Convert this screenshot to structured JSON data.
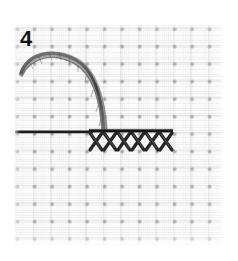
{
  "image": {
    "kind": "embroidery-instruction-photo",
    "subject": "cross-stitch row worked on white aida fabric",
    "width": 238,
    "height": 261,
    "background_color": "#ffffff"
  },
  "step": {
    "number": "4",
    "label": "step-number-4"
  },
  "fabric": {
    "name": "aida-cloth",
    "base_color": "#fbfbfb",
    "thread_band_color": "#cdcfd2",
    "intersection_dot_color": "#787c82",
    "grid_pitch_px": 17.5,
    "bounds": {
      "left": 13,
      "top": 25,
      "width": 209,
      "height": 221
    }
  },
  "elements": {
    "thread_loop": {
      "name": "curved-thread-loop",
      "color": "#4a4a4a",
      "description": "twisted floss arcing from upper-left down to the stitch row",
      "start": {
        "x": 22,
        "y": 72
      },
      "apex": {
        "x": 62,
        "y": 53
      },
      "end": {
        "x": 104,
        "y": 128
      }
    },
    "needle_line": {
      "name": "horizontal-needle-thread",
      "color": "#1c1c1c",
      "description": "straight dark thread/needle entering from the left edge",
      "start": {
        "x": 15,
        "y": 132
      },
      "end": {
        "x": 92,
        "y": 132
      }
    },
    "stitch_top_bar": {
      "name": "stitch-row-top-bar",
      "color": "#141414",
      "start": {
        "x": 90,
        "y": 131
      },
      "end": {
        "x": 172,
        "y": 131
      }
    },
    "cross_stitches": {
      "name": "cross-stitch-row",
      "color": "#2b2b2b",
      "count": 6,
      "row_top": 133,
      "row_height": 18,
      "stitch_width": 14,
      "first_left": 90,
      "pitch": 14
    }
  },
  "colors": {
    "paper_white": "#ffffff",
    "fabric_white": "#fbfbfb",
    "floss_dark": "#2b2b2b",
    "needle_black": "#1c1c1c",
    "number_black": "#161616"
  }
}
